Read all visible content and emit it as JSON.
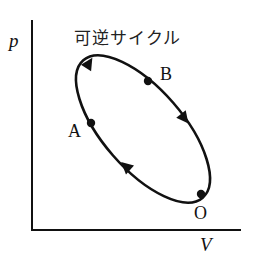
{
  "diagram": {
    "title": "可逆サイクル",
    "axes": {
      "y_label": "p",
      "x_label": "V"
    },
    "points": [
      {
        "id": "A",
        "label": "A"
      },
      {
        "id": "B",
        "label": "B"
      },
      {
        "id": "O",
        "label": "O"
      }
    ],
    "cycle": {
      "shape": "ellipse",
      "direction": "clockwise",
      "description": "Closed reversible cycle through O, A, B on a p-V diagram"
    },
    "colors": {
      "stroke": "#111111",
      "background": "#ffffff"
    }
  }
}
